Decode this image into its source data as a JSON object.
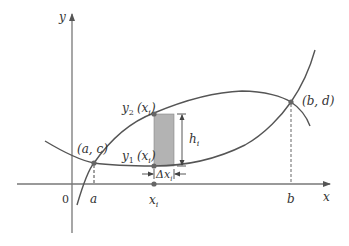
{
  "figure": {
    "axes": {
      "x_label": "x",
      "y_label": "y",
      "origin_label": "0"
    },
    "tick_labels": {
      "a": "a",
      "b": "b",
      "xi": "x",
      "xi_sub": "i"
    },
    "points": {
      "left_intersection": "(a, c)",
      "right_intersection": "(b, d)",
      "upper_point_prefix": "y",
      "upper_point_sub": "2",
      "upper_point_arg": "(x",
      "upper_point_arg_sub": "i",
      "upper_point_close": ")",
      "lower_point_prefix": "y",
      "lower_point_sub": "1",
      "lower_point_arg": "(x",
      "lower_point_arg_sub": "i",
      "lower_point_close": ")"
    },
    "rectangle": {
      "height_label": "h",
      "height_sub": "i",
      "width_label": "Δx",
      "width_sub": "i"
    },
    "colors": {
      "curve": "#555555",
      "axis": "#666666",
      "rect_fill": "#b3b3b3",
      "point": "#666666",
      "text": "#333333"
    }
  }
}
